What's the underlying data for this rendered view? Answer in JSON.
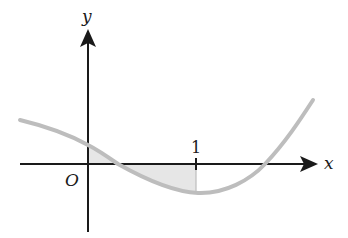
{
  "diagram": {
    "type": "function-graph",
    "axes": {
      "x_label": "x",
      "y_label": "y",
      "origin_label": "O"
    },
    "ticks": [
      {
        "label": "1",
        "position": "x"
      }
    ],
    "curve": {
      "description": "cubic-like curve decreasing, crossing positive x-axis, minimum near x=1, then increasing",
      "color": "#bdbdbd"
    },
    "shaded_region": {
      "description": "area between curve and x-axis from x=0 to x=1",
      "color": "#e6e6e6"
    },
    "colors": {
      "axis": "#1a1a1a",
      "curve": "#bdbdbd",
      "shade": "#e6e6e6"
    }
  }
}
